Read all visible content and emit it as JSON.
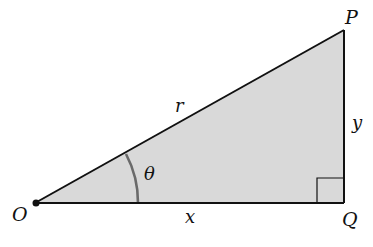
{
  "diagram": {
    "type": "right-triangle",
    "colors": {
      "fill": "#d9d9d9",
      "stroke": "#111111",
      "arc": "#6a6a6a",
      "background": "#ffffff"
    },
    "vertices": {
      "O": {
        "label": "O"
      },
      "P": {
        "label": "P"
      },
      "Q": {
        "label": "Q"
      }
    },
    "sides": {
      "hypotenuse": {
        "label": "r",
        "from": "O",
        "to": "P"
      },
      "adjacent": {
        "label": "x",
        "from": "O",
        "to": "Q"
      },
      "opposite": {
        "label": "y",
        "from": "Q",
        "to": "P"
      }
    },
    "angle": {
      "label": "θ",
      "at": "O"
    },
    "right_angle_marker": {
      "at": "Q"
    }
  }
}
